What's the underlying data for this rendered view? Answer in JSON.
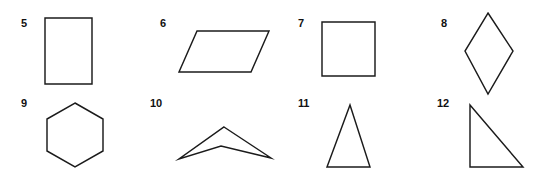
{
  "worksheet": {
    "title": "Polygon identification figures 5-12",
    "background_color": "#ffffff",
    "stroke_color": "#1b1b1b",
    "fill_color": "#ffffff",
    "label_color": "#111111",
    "width": 554,
    "height": 180,
    "columns": 4,
    "rows": 2
  },
  "figures": [
    {
      "number": "5",
      "shape_name": "rectangle",
      "label_x": 21,
      "label_y": 18,
      "svg": {
        "x": 40,
        "y": 12,
        "w": 60,
        "h": 78
      },
      "points": "5,6 52,6 52,72 5,72"
    },
    {
      "number": "6",
      "shape_name": "parallelogram",
      "label_x": 160,
      "label_y": 18,
      "svg": {
        "x": 172,
        "y": 22,
        "w": 104,
        "h": 60
      },
      "points": "25,9 97,9 79,50 7,50"
    },
    {
      "number": "7",
      "shape_name": "square",
      "label_x": 298,
      "label_y": 18,
      "svg": {
        "x": 315,
        "y": 14,
        "w": 70,
        "h": 72
      },
      "points": "7,8 60,8 60,62 7,62"
    },
    {
      "number": "8",
      "shape_name": "rhombus",
      "label_x": 441,
      "label_y": 18,
      "svg": {
        "x": 455,
        "y": 6,
        "w": 70,
        "h": 94
      },
      "points": "33,7 58,45 33,88 10,45"
    },
    {
      "number": "9",
      "shape_name": "hexagon",
      "label_x": 21,
      "label_y": 98,
      "svg": {
        "x": 38,
        "y": 98,
        "w": 76,
        "h": 76
      },
      "points": "37,5 65,21 65,53 37,69 9,53 9,21"
    },
    {
      "number": "10",
      "shape_name": "concave-chevron-quadrilateral",
      "label_x": 150,
      "label_y": 98,
      "svg": {
        "x": 170,
        "y": 118,
        "w": 110,
        "h": 50
      },
      "points": "54,9 101,40 51,28 9,41"
    },
    {
      "number": "11",
      "shape_name": "isosceles-triangle",
      "label_x": 298,
      "label_y": 98,
      "svg": {
        "x": 318,
        "y": 98,
        "w": 62,
        "h": 76
      },
      "points": "32,7 52,69 9,69"
    },
    {
      "number": "12",
      "shape_name": "right-triangle",
      "label_x": 437,
      "label_y": 98,
      "svg": {
        "x": 460,
        "y": 98,
        "w": 72,
        "h": 76
      },
      "points": "10,7 10,69 63,69"
    }
  ]
}
